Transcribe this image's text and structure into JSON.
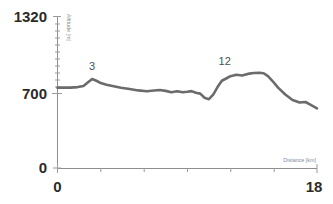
{
  "chart_data": {
    "type": "line",
    "title": "",
    "xlabel": "Distance [km]",
    "ylabel": "Altitude [m]",
    "xlim": [
      0,
      18
    ],
    "ylim": [
      0,
      1320
    ],
    "grid": false,
    "legend": null,
    "x_ticks": [
      0,
      3,
      6,
      9,
      12,
      15,
      18
    ],
    "x_tick_labels": [
      "0",
      "",
      "",
      "",
      "",
      "",
      "18"
    ],
    "y_ticks": [
      0,
      700,
      1320
    ],
    "y_tick_labels": [
      "0",
      "700",
      "1320"
    ],
    "y_minor_ticks": [
      880,
      1000,
      1100,
      1200,
      1260
    ],
    "line_color": "#6b6b6b",
    "axis_color": "#8e8e8e",
    "series": [
      {
        "name": "elevation profile",
        "x": [
          0.0,
          0.4,
          0.9,
          1.4,
          1.8,
          2.1,
          2.4,
          2.7,
          3.0,
          3.4,
          3.9,
          4.4,
          5.0,
          5.6,
          6.2,
          6.7,
          7.1,
          7.5,
          7.9,
          8.3,
          8.7,
          9.0,
          9.3,
          9.6,
          9.9,
          10.2,
          10.5,
          10.8,
          11.1,
          11.4,
          11.7,
          12.0,
          12.4,
          12.8,
          13.2,
          13.6,
          14.0,
          14.3,
          14.6,
          14.9,
          15.3,
          15.8,
          16.3,
          16.8,
          17.2,
          17.6,
          18.0
        ],
        "y": [
          700,
          700,
          700,
          705,
          715,
          745,
          775,
          760,
          740,
          725,
          712,
          700,
          688,
          676,
          668,
          675,
          680,
          672,
          660,
          668,
          660,
          664,
          670,
          655,
          648,
          612,
          600,
          640,
          705,
          760,
          780,
          800,
          812,
          806,
          820,
          828,
          830,
          826,
          800,
          760,
          700,
          640,
          592,
          570,
          575,
          548,
          520
        ]
      }
    ],
    "annotations": [
      {
        "label": "3",
        "x": 2.4,
        "y": 775
      },
      {
        "label": "12",
        "x": 11.6,
        "y": 820
      }
    ]
  }
}
